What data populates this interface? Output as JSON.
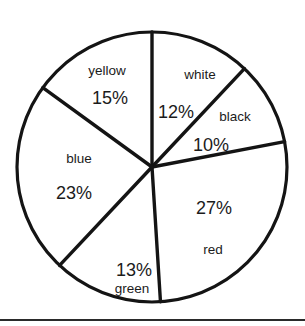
{
  "chart_data": {
    "type": "pie",
    "title": "",
    "subtitle": "",
    "xlabel": "",
    "ylabel": "",
    "legend_position": "none",
    "grid": false,
    "labels_inside_slices": true,
    "units": "percent",
    "total": 100,
    "categories": [
      "white",
      "black",
      "red",
      "green",
      "blue",
      "yellow"
    ],
    "values": [
      12,
      10,
      27,
      13,
      23,
      15
    ],
    "slices": [
      {
        "name": "white",
        "value": 12,
        "value_label": "12%",
        "fill": "#ffffff",
        "start_angle_deg": 0,
        "end_angle_deg": 43.2,
        "name_x": 200,
        "name_y": 75,
        "pct_x": 176,
        "pct_y": 112
      },
      {
        "name": "black",
        "value": 10,
        "value_label": "10%",
        "fill": "#ffffff",
        "start_angle_deg": 43.2,
        "end_angle_deg": 79.2,
        "name_x": 235,
        "name_y": 117,
        "pct_x": 211,
        "pct_y": 145
      },
      {
        "name": "red",
        "value": 27,
        "value_label": "27%",
        "fill": "#ffffff",
        "start_angle_deg": 79.2,
        "end_angle_deg": 176.4,
        "name_x": 213,
        "name_y": 250,
        "pct_x": 214,
        "pct_y": 208
      },
      {
        "name": "green",
        "value": 13,
        "value_label": "13%",
        "fill": "#ffffff",
        "start_angle_deg": 176.4,
        "end_angle_deg": 223.2,
        "name_x": 132,
        "name_y": 289,
        "pct_x": 134,
        "pct_y": 270
      },
      {
        "name": "blue",
        "value": 23,
        "value_label": "23%",
        "fill": "#ffffff",
        "start_angle_deg": 223.2,
        "end_angle_deg": 306.0,
        "name_x": 79,
        "name_y": 159,
        "pct_x": 74,
        "pct_y": 193
      },
      {
        "name": "yellow",
        "value": 15,
        "value_label": "15%",
        "fill": "#ffffff",
        "start_angle_deg": 306.0,
        "end_angle_deg": 360,
        "name_x": 107,
        "name_y": 71,
        "pct_x": 110,
        "pct_y": 98
      }
    ],
    "geometry": {
      "center_x": 152,
      "center_y": 167,
      "radius": 135,
      "start_at_top": true,
      "direction": "clockwise"
    },
    "stroke_color": "#141414",
    "background_color": "#ffffff"
  }
}
